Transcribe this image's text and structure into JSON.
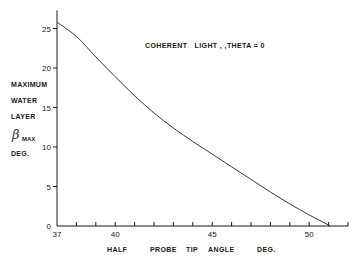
{
  "chart_data": {
    "type": "line",
    "title": "",
    "annotation": "COHERENT   LIGHT , ,THETA = 0",
    "xlabel_parts": [
      "HALF",
      "PROBE",
      "TIP",
      "ANGLE",
      "DEG."
    ],
    "xlabel": "HALF PROBE TIP ANGLE DEG.",
    "ylabel_lines": [
      "MAXIMUM",
      "WATER",
      "LAYER"
    ],
    "ylabel_symbol": "β",
    "ylabel_subscript": "MAX",
    "ylabel_units": "DEG.",
    "ylabel": "MAXIMUM WATER LAYER β_MAX DEG.",
    "xlim": [
      37,
      52
    ],
    "ylim": [
      0,
      27.3
    ],
    "x_ticks_labeled": [
      37,
      40,
      45,
      50
    ],
    "x_ticks_minor": [
      38,
      39,
      41,
      42,
      43,
      44,
      46,
      47,
      48,
      49,
      51,
      52
    ],
    "y_ticks": [
      0,
      5,
      10,
      15,
      20,
      25
    ],
    "grid": false,
    "legend": null,
    "series": [
      {
        "name": "Coherent light, theta = 0",
        "x": [
          37,
          38,
          39,
          40,
          41,
          42,
          43,
          44,
          45,
          46,
          47,
          48,
          49,
          50,
          51.1
        ],
        "y": [
          25.8,
          24.0,
          21.4,
          18.9,
          16.5,
          14.3,
          12.4,
          10.7,
          9.1,
          7.5,
          5.9,
          4.3,
          2.8,
          1.4,
          0
        ]
      }
    ]
  },
  "colors": {
    "background": "#ffffff",
    "ink": "#1a1a1a",
    "curve": "#3a3a3a"
  },
  "layout": {
    "origin_x_px": 57,
    "origin_y_px": 226,
    "px_per_x_unit": 19.4,
    "px_per_y_unit": 7.9
  }
}
